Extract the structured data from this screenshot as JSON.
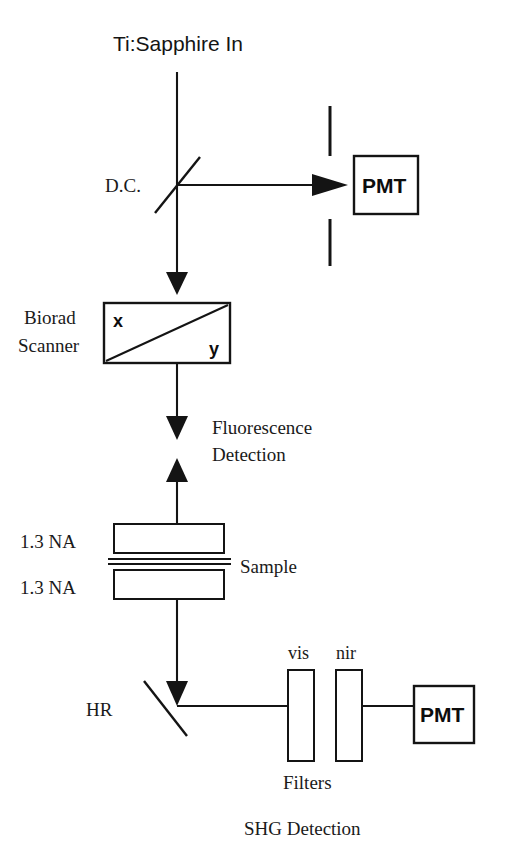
{
  "diagram": {
    "title": "Ti:Sapphire In",
    "caption": "SHG Detection",
    "background_color": "#ffffff",
    "ink_color": "#141414",
    "labels": {
      "source": "Ti:Sapphire In",
      "dichroic": "D.C.",
      "scanner_line1": "Biorad",
      "scanner_line2": "Scanner",
      "scanner_axis_x": "x",
      "scanner_axis_y": "y",
      "fluorescence_line1": "Fluorescence",
      "fluorescence_line2": "Detection",
      "objective_top": "1.3 NA",
      "objective_bottom": "1.3 NA",
      "sample": "Sample",
      "hr_mirror": "HR",
      "filter_vis": "vis",
      "filter_nir": "nir",
      "filters_group": "Filters",
      "pmt_top": "PMT",
      "pmt_bottom": "PMT",
      "shg_detection": "SHG Detection"
    },
    "components": [
      {
        "id": "source-beam",
        "name": "Ti:Sapphire input beam",
        "type": "beam"
      },
      {
        "id": "dichroic-mirror",
        "name": "D.C.",
        "type": "dichroic-mirror"
      },
      {
        "id": "aperture-slit",
        "name": "aperture",
        "type": "slit-pair"
      },
      {
        "id": "pmt-top",
        "name": "PMT",
        "type": "detector"
      },
      {
        "id": "biorad-scanner",
        "name": "Biorad Scanner",
        "type": "xy-scanner"
      },
      {
        "id": "fluorescence-focus",
        "name": "Fluorescence Detection",
        "type": "focus"
      },
      {
        "id": "objective-top",
        "name": "1.3 NA",
        "type": "objective"
      },
      {
        "id": "sample-slide",
        "name": "Sample",
        "type": "sample"
      },
      {
        "id": "objective-bottom",
        "name": "1.3 NA",
        "type": "objective"
      },
      {
        "id": "hr-mirror",
        "name": "HR",
        "type": "mirror"
      },
      {
        "id": "filter-vis",
        "name": "vis",
        "type": "filter"
      },
      {
        "id": "filter-nir",
        "name": "nir",
        "type": "filter"
      },
      {
        "id": "pmt-bottom",
        "name": "PMT",
        "type": "detector"
      }
    ]
  }
}
